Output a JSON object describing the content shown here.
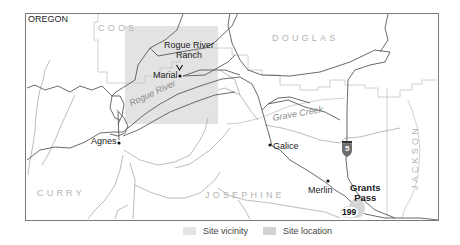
{
  "map": {
    "state_label": "OREGON",
    "counties": [
      "COOS",
      "DOUGLAS",
      "CURRY",
      "JOSEPHINE",
      "JACKSON"
    ],
    "places": [
      {
        "name": "Rogue River Ranch",
        "line1": "Rogue River",
        "line2": "Ranch",
        "marker": "arrow-down"
      },
      {
        "name": "Marial",
        "marker": "dot"
      },
      {
        "name": "Agnes",
        "marker": "dot"
      },
      {
        "name": "Galice",
        "marker": "dot"
      },
      {
        "name": "Merlin",
        "marker": "dot"
      },
      {
        "name": "Grants Pass",
        "line1": "Grants",
        "line2": "Pass",
        "emphasis": "bold"
      }
    ],
    "waterways": [
      "Rogue River",
      "Grave Creek"
    ],
    "highways": [
      {
        "type": "interstate",
        "number": "5"
      },
      {
        "type": "us-route",
        "number": "199"
      }
    ],
    "colors": {
      "site_vicinity": "#e3e3e3",
      "site_location": "#d2d2d2",
      "county_line": "#bdbdbd",
      "river": "#555555",
      "road": "#a8a8a8",
      "frame": "#777777",
      "interstate_shield": "#6e6e6e"
    }
  },
  "legend": {
    "items": [
      {
        "label": "Site vicinity",
        "color": "#e3e3e3"
      },
      {
        "label": "Site location",
        "color": "#d2d2d2"
      }
    ]
  }
}
